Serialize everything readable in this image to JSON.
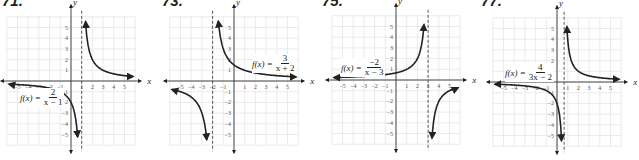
{
  "chart_data": [
    {
      "type": "line",
      "label": "71.",
      "title": "f(x) = 2/(x-1)",
      "formula": {
        "lhs": "f(x) =",
        "numerator": "2",
        "denominator": "x − 1"
      },
      "xlabel": "x",
      "ylabel": "y",
      "xlim": [
        -6,
        6
      ],
      "ylim": [
        -6,
        6
      ],
      "xticks": [
        -5,
        -4,
        -3,
        -2,
        -1,
        1,
        2,
        3,
        4,
        5
      ],
      "yticks": [
        -5,
        -4,
        -3,
        -2,
        -1,
        1,
        2,
        3,
        4,
        5
      ],
      "grid": true,
      "vertical_asymptote": 1,
      "horizontal_asymptote": 0,
      "numerator": 2,
      "a": 1,
      "b": -1,
      "branches": [
        {
          "x": [
            -5.8,
            -5,
            -4,
            -3,
            -2,
            -1,
            0,
            0.5,
            0.64
          ],
          "y": [
            -0.29,
            -0.33,
            -0.4,
            -0.5,
            -0.67,
            -1,
            -2,
            -4,
            -5.6
          ]
        },
        {
          "x": [
            1.36,
            1.5,
            2,
            3,
            4,
            5,
            5.8
          ],
          "y": [
            5.6,
            4,
            2,
            1,
            0.67,
            0.5,
            0.42
          ]
        }
      ]
    },
    {
      "type": "line",
      "label": "73.",
      "title": "f(x) = 3/(x+2)",
      "formula": {
        "lhs": "f(x) =",
        "numerator": "3",
        "denominator": "x + 2"
      },
      "xlabel": "x",
      "ylabel": "y",
      "xlim": [
        -6,
        6
      ],
      "ylim": [
        -6,
        6
      ],
      "xticks": [
        -5,
        -4,
        -3,
        -2,
        -1,
        1,
        2,
        3,
        4,
        5
      ],
      "yticks": [
        -5,
        -4,
        -3,
        -2,
        -1,
        1,
        2,
        3,
        4,
        5
      ],
      "grid": true,
      "vertical_asymptote": -2,
      "horizontal_asymptote": 0,
      "numerator": 3,
      "a": 1,
      "b": 2,
      "branches": [
        {
          "x": [
            -5.8,
            -5,
            -4,
            -3,
            -2.5,
            -2.54
          ],
          "y": [
            -0.79,
            -1,
            -1.5,
            -3,
            -6,
            -5.6
          ]
        },
        {
          "x": [
            -1.46,
            -1.5,
            -1,
            0,
            1,
            2,
            3,
            4,
            5,
            5.8
          ],
          "y": [
            5.6,
            6,
            3,
            1.5,
            1,
            0.75,
            0.6,
            0.5,
            0.43,
            0.38
          ]
        }
      ]
    },
    {
      "type": "line",
      "label": "75.",
      "title": "f(x) = -2/(x-3)",
      "formula": {
        "lhs": "f(x) =",
        "numerator": "−2",
        "denominator": "x − 3"
      },
      "xlabel": "x",
      "ylabel": "y",
      "xlim": [
        -6,
        6
      ],
      "ylim": [
        -6,
        6
      ],
      "xticks": [
        -5,
        -4,
        -3,
        -2,
        -1,
        1,
        2,
        3,
        4,
        5
      ],
      "yticks": [
        -5,
        -4,
        -3,
        -2,
        -1,
        1,
        2,
        3,
        4,
        5
      ],
      "grid": true,
      "vertical_asymptote": 3,
      "horizontal_asymptote": 0,
      "numerator": -2,
      "a": 1,
      "b": -3,
      "branches": [
        {
          "x": [
            -5.8,
            -5,
            -3,
            -1,
            0,
            1,
            2,
            2.5,
            2.64
          ],
          "y": [
            0.23,
            0.25,
            0.33,
            0.5,
            0.67,
            1,
            2,
            4,
            5.6
          ]
        },
        {
          "x": [
            3.36,
            3.5,
            4,
            5,
            5.8
          ],
          "y": [
            -5.6,
            -4,
            -2,
            -1,
            -0.71
          ]
        }
      ]
    },
    {
      "type": "line",
      "label": "77.",
      "title": "f(x) = 4/(3x-2)",
      "formula": {
        "lhs": "f(x) =",
        "numerator": "4",
        "denominator": "3x − 2"
      },
      "xlabel": "x",
      "ylabel": "y",
      "xlim": [
        -6,
        6
      ],
      "ylim": [
        -6,
        6
      ],
      "xticks": [
        -5,
        -4,
        -3,
        -2,
        -1,
        1,
        2,
        3,
        4,
        5
      ],
      "yticks": [
        -5,
        -4,
        -3,
        -2,
        -1,
        1,
        2,
        3,
        4,
        5
      ],
      "grid": true,
      "vertical_asymptote": 0.667,
      "horizontal_asymptote": 0,
      "numerator": 4,
      "a": 3,
      "b": -2,
      "branches": [
        {
          "x": [
            -5.8,
            -5,
            -3,
            -1,
            0,
            0.3,
            0.43
          ],
          "y": [
            -0.21,
            -0.24,
            -0.36,
            -0.8,
            -2,
            -3.64,
            -5.6
          ]
        },
        {
          "x": [
            0.9,
            1,
            1.5,
            2,
            3,
            4,
            5,
            5.8
          ],
          "y": [
            5.6,
            4,
            1.6,
            1,
            0.57,
            0.4,
            0.31,
            0.26
          ]
        }
      ]
    }
  ],
  "panels": [
    {
      "label": "71.",
      "formula": {
        "lhs": "f(x) =",
        "num": "2",
        "den": "x − 1"
      }
    },
    {
      "label": "73.",
      "formula": {
        "lhs": "f(x) =",
        "num": "3",
        "den": "x + 2"
      }
    },
    {
      "label": "75.",
      "formula": {
        "lhs": "f(x) =",
        "num": "−2",
        "den": "x − 3"
      }
    },
    {
      "label": "77.",
      "formula": {
        "lhs": "f(x) =",
        "num": "4",
        "den": "3x − 2"
      }
    }
  ],
  "colors": {
    "grid": "#e2e2e2",
    "axis": "#333333",
    "curve": "#222222",
    "asymptote": "#444444",
    "tick_label": "#555555"
  }
}
